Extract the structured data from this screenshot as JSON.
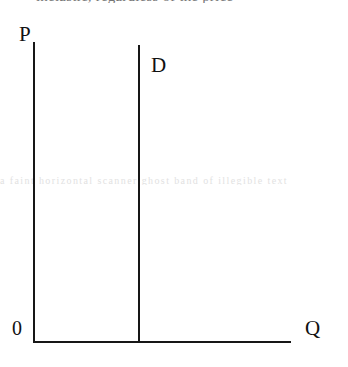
{
  "figure": {
    "type": "economics-supply-demand-diagram",
    "background_color": "#ffffff",
    "line_color": "#171717"
  },
  "clipped_caption": {
    "text": "inelastic, regardless of the price",
    "note": "top line of page text cropped by the screenshot; only glyph bottoms visible"
  },
  "scan_artifact": {
    "text": "a faint horizontal scanner ghost band of illegible text"
  },
  "axes": {
    "vertical": {
      "label": "P",
      "meaning": "Price"
    },
    "horizontal": {
      "label": "Q",
      "meaning": "Quantity"
    },
    "origin": {
      "label": "0"
    }
  },
  "curves": [
    {
      "label": "D",
      "name": "demand-curve",
      "shape": "vertical",
      "meaning": "perfectly inelastic demand"
    }
  ],
  "chart_data": {
    "type": "line",
    "title": "",
    "xlabel": "Q",
    "ylabel": "P",
    "series": [
      {
        "name": "D",
        "x": [
          1,
          1
        ],
        "y": [
          0,
          1
        ]
      }
    ],
    "xlim": [
      0,
      1
    ],
    "ylim": [
      0,
      1
    ],
    "grid": false,
    "legend": "none",
    "annotations": [
      "P",
      "Q",
      "D",
      "0"
    ]
  }
}
